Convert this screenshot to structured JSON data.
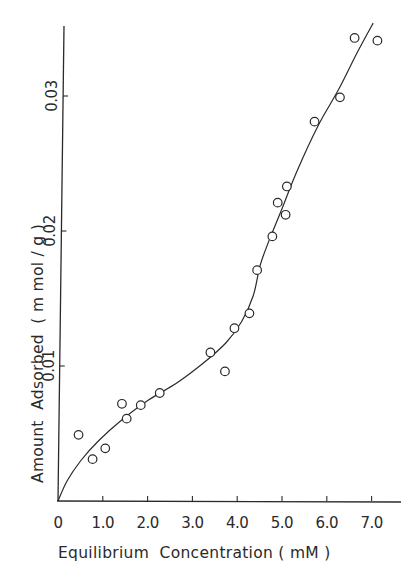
{
  "chart_data": {
    "type": "scatter",
    "title": "",
    "xlabel": "Equilibrium  Concentration ( mM )",
    "ylabel": "Amount  Adsorbed  ( m mol / g )",
    "xlim": [
      0,
      7.5
    ],
    "ylim": [
      0,
      0.035
    ],
    "grid": false,
    "legend": null,
    "x_ticks": [
      {
        "value": 0,
        "label": "0"
      },
      {
        "value": 1.0,
        "label": "1.0"
      },
      {
        "value": 2.0,
        "label": "2.0"
      },
      {
        "value": 3.0,
        "label": "3.0"
      },
      {
        "value": 4.0,
        "label": "4.0"
      },
      {
        "value": 5.0,
        "label": "5.0"
      },
      {
        "value": 6.0,
        "label": "6.0"
      },
      {
        "value": 7.0,
        "label": "7.0"
      }
    ],
    "y_ticks": [
      {
        "value": 0.01,
        "label": "0.01"
      },
      {
        "value": 0.02,
        "label": "0.02"
      },
      {
        "value": 0.03,
        "label": "0.03"
      }
    ],
    "series": [
      {
        "name": "observed",
        "marker": "open-circle",
        "points": [
          {
            "x": 0.44,
            "y": 0.0049
          },
          {
            "x": 0.76,
            "y": 0.0031
          },
          {
            "x": 1.04,
            "y": 0.0039
          },
          {
            "x": 1.4,
            "y": 0.0072
          },
          {
            "x": 1.51,
            "y": 0.0061
          },
          {
            "x": 1.82,
            "y": 0.0071
          },
          {
            "x": 2.24,
            "y": 0.008
          },
          {
            "x": 3.36,
            "y": 0.011
          },
          {
            "x": 3.69,
            "y": 0.0096
          },
          {
            "x": 3.89,
            "y": 0.0128
          },
          {
            "x": 4.22,
            "y": 0.0139
          },
          {
            "x": 4.38,
            "y": 0.0171
          },
          {
            "x": 4.71,
            "y": 0.0196
          },
          {
            "x": 4.82,
            "y": 0.0221
          },
          {
            "x": 5.0,
            "y": 0.0212
          },
          {
            "x": 5.02,
            "y": 0.0233
          },
          {
            "x": 5.62,
            "y": 0.0281
          },
          {
            "x": 6.18,
            "y": 0.0299
          },
          {
            "x": 6.49,
            "y": 0.0343
          },
          {
            "x": 7.0,
            "y": 0.0341
          }
        ]
      },
      {
        "name": "fitted curve",
        "marker": "line",
        "points": [
          {
            "x": 0.0,
            "y": 0.0
          },
          {
            "x": 0.2,
            "y": 0.0015
          },
          {
            "x": 0.5,
            "y": 0.003
          },
          {
            "x": 0.9,
            "y": 0.0045
          },
          {
            "x": 1.4,
            "y": 0.006
          },
          {
            "x": 2.0,
            "y": 0.0075
          },
          {
            "x": 2.6,
            "y": 0.0087
          },
          {
            "x": 3.2,
            "y": 0.0102
          },
          {
            "x": 3.7,
            "y": 0.0117
          },
          {
            "x": 4.05,
            "y": 0.0133
          },
          {
            "x": 4.3,
            "y": 0.0152
          },
          {
            "x": 4.45,
            "y": 0.0175
          },
          {
            "x": 4.65,
            "y": 0.0194
          },
          {
            "x": 4.9,
            "y": 0.0215
          },
          {
            "x": 5.25,
            "y": 0.0245
          },
          {
            "x": 5.7,
            "y": 0.0278
          },
          {
            "x": 6.15,
            "y": 0.0305
          },
          {
            "x": 6.55,
            "y": 0.0332
          },
          {
            "x": 6.9,
            "y": 0.0354
          }
        ]
      }
    ]
  }
}
